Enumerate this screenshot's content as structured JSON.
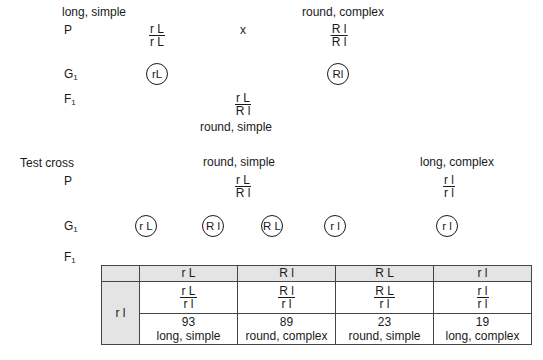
{
  "cross1": {
    "row_labels": {
      "p": "P",
      "g1": "G",
      "g1_sub": "1",
      "f1": "F",
      "f1_sub": "1"
    },
    "parent1": {
      "phenotype": "long, simple",
      "genotype_top": "r L",
      "genotype_bottom": "r L",
      "gamete": "rL"
    },
    "cross_symbol": "x",
    "parent2": {
      "phenotype": "round, complex",
      "genotype_top": "R l",
      "genotype_bottom": "R l",
      "gamete": "Rl"
    },
    "f1": {
      "genotype_top": "r L",
      "genotype_bottom": "R l",
      "phenotype": "round, simple"
    }
  },
  "test_cross": {
    "title": "Test cross",
    "row_labels": {
      "p": "P",
      "g1": "G",
      "g1_sub": "1",
      "f1": "F",
      "f1_sub": "1"
    },
    "parent1": {
      "phenotype": "round, simple",
      "genotype_top": "r L",
      "genotype_bottom": "R l"
    },
    "parent2": {
      "phenotype": "long, complex",
      "genotype_top": "r l",
      "genotype_bottom": "r l",
      "gamete": "r l"
    },
    "gametes": [
      "r L",
      "R l",
      "R L",
      "r l"
    ]
  },
  "punnett": {
    "header": [
      "r L",
      "R l",
      "R L",
      "r l"
    ],
    "row_gamete": "r l",
    "cells": [
      {
        "genotype_top": "r L",
        "genotype_bottom": "r l",
        "count": "93",
        "phenotype": "long, simple"
      },
      {
        "genotype_top": "R l",
        "genotype_bottom": "r l",
        "count": "89",
        "phenotype": "round, complex"
      },
      {
        "genotype_top": "R L",
        "genotype_bottom": "r l",
        "count": "23",
        "phenotype": "round, simple"
      },
      {
        "genotype_top": "r l",
        "genotype_bottom": "r l",
        "count": "19",
        "phenotype": "long, complex"
      }
    ]
  }
}
